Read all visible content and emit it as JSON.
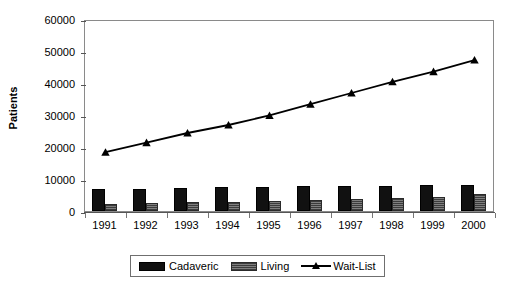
{
  "chart_data": {
    "type": "bar",
    "title": "",
    "xlabel": "",
    "ylabel": "Patients",
    "categories": [
      "1991",
      "1992",
      "1993",
      "1994",
      "1995",
      "1996",
      "1997",
      "1998",
      "1999",
      "2000"
    ],
    "ylim": [
      0,
      60000
    ],
    "ytick_labels": [
      "0",
      "10000",
      "20000",
      "30000",
      "40000",
      "50000",
      "60000"
    ],
    "ytick_values": [
      0,
      10000,
      20000,
      30000,
      40000,
      50000,
      60000
    ],
    "grid": false,
    "legend_position": "bottom",
    "series": [
      {
        "name": "Cadaveric",
        "type": "bar",
        "color": "#111111",
        "values": [
          6900,
          7000,
          7300,
          7500,
          7600,
          7700,
          7700,
          7900,
          8000,
          8000
        ]
      },
      {
        "name": "Living",
        "type": "bar",
        "color": "#6d6d6d",
        "values": [
          2100,
          2400,
          2700,
          2800,
          3100,
          3400,
          3800,
          4100,
          4500,
          5400
        ]
      },
      {
        "name": "Wait-List",
        "type": "line",
        "color": "#000000",
        "marker": "triangle",
        "values": [
          19000,
          22000,
          25000,
          27500,
          30500,
          34000,
          37500,
          41000,
          44200,
          47800
        ]
      }
    ]
  },
  "legend": {
    "items": [
      {
        "label": "Cadaveric",
        "marker": "filled-square-dark"
      },
      {
        "label": "Living",
        "marker": "filled-square-hatched"
      },
      {
        "label": "Wait-List",
        "marker": "line-with-triangle"
      }
    ]
  }
}
